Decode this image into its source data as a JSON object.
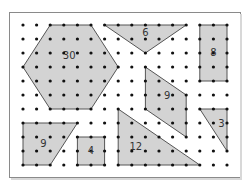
{
  "figure": {
    "grid": {
      "cols": 16,
      "rows": 11,
      "origin_x": 23,
      "origin_y": 25,
      "dx": 13.6,
      "dy": 14
    },
    "colors": {
      "fill": "#d3d3d3",
      "stroke": "#555555",
      "dot": "#111111",
      "frame": "#8a8a8a"
    },
    "shapes": [
      {
        "name": "hexagon",
        "label": "30",
        "points": [
          [
            2,
            0
          ],
          [
            5,
            0
          ],
          [
            7,
            3
          ],
          [
            5,
            6
          ],
          [
            2,
            6
          ],
          [
            0,
            3
          ]
        ],
        "label_at": [
          3.4,
          2.2
        ]
      },
      {
        "name": "triangle-top",
        "label": "6",
        "points": [
          [
            6,
            0
          ],
          [
            12,
            0
          ],
          [
            9,
            2
          ]
        ],
        "label_at": [
          9,
          0.55
        ]
      },
      {
        "name": "rectangle",
        "label": "8",
        "points": [
          [
            13,
            0
          ],
          [
            15,
            0
          ],
          [
            15,
            4
          ],
          [
            13,
            4
          ]
        ],
        "label_at": [
          14,
          2
        ]
      },
      {
        "name": "parallelogram",
        "label": "9",
        "points": [
          [
            9,
            3
          ],
          [
            12,
            5
          ],
          [
            12,
            8
          ],
          [
            9,
            6
          ]
        ],
        "label_at": [
          10.6,
          5.1
        ]
      },
      {
        "name": "triangle-right",
        "label": "3",
        "points": [
          [
            13,
            6
          ],
          [
            15,
            6
          ],
          [
            15,
            9
          ]
        ],
        "label_at": [
          14.6,
          7.1
        ]
      },
      {
        "name": "trapezoid",
        "label": "9",
        "points": [
          [
            0,
            7
          ],
          [
            4,
            7
          ],
          [
            2,
            10
          ],
          [
            0,
            10
          ]
        ],
        "label_at": [
          1.5,
          8.5
        ]
      },
      {
        "name": "square",
        "label": "4",
        "points": [
          [
            4,
            8
          ],
          [
            6,
            8
          ],
          [
            6,
            10
          ],
          [
            4,
            10
          ]
        ],
        "label_at": [
          5,
          9
        ]
      },
      {
        "name": "triangle-bottom",
        "label": "12",
        "points": [
          [
            7,
            6
          ],
          [
            13,
            10
          ],
          [
            7,
            10
          ]
        ],
        "label_at": [
          8.3,
          8.7
        ]
      }
    ]
  }
}
